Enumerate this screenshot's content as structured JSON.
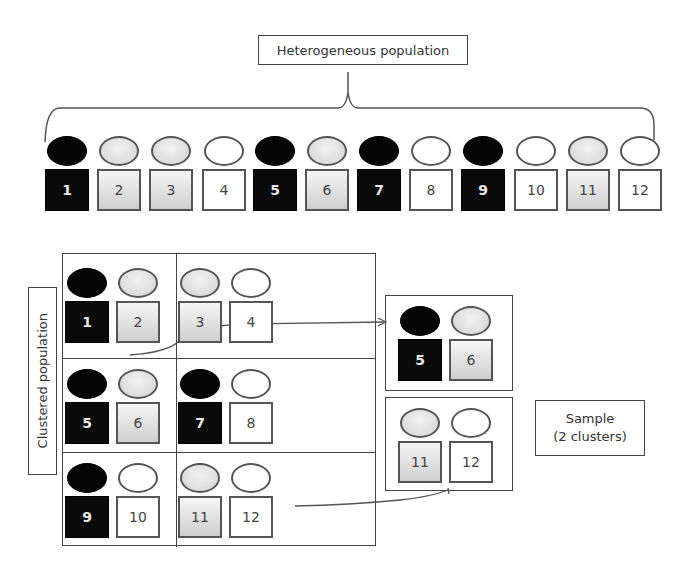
{
  "title_label": "Heterogeneous population",
  "population": [
    {
      "id": "1",
      "shade": "black"
    },
    {
      "id": "2",
      "shade": "gray"
    },
    {
      "id": "3",
      "shade": "gray"
    },
    {
      "id": "4",
      "shade": "white"
    },
    {
      "id": "5",
      "shade": "black"
    },
    {
      "id": "6",
      "shade": "gray"
    },
    {
      "id": "7",
      "shade": "black"
    },
    {
      "id": "8",
      "shade": "white"
    },
    {
      "id": "9",
      "shade": "black"
    },
    {
      "id": "10",
      "shade": "white"
    },
    {
      "id": "11",
      "shade": "gray"
    },
    {
      "id": "12",
      "shade": "white"
    }
  ],
  "clustered_label": "Clustered population",
  "clusters": [
    {
      "members": [
        "1",
        "2"
      ]
    },
    {
      "members": [
        "3",
        "4"
      ]
    },
    {
      "members": [
        "5",
        "6"
      ]
    },
    {
      "members": [
        "7",
        "8"
      ]
    },
    {
      "members": [
        "9",
        "10"
      ]
    },
    {
      "members": [
        "11",
        "12"
      ]
    }
  ],
  "sample": {
    "label_line1": "Sample",
    "label_line2": "(2 clusters)",
    "clusters": [
      {
        "members": [
          "5",
          "6"
        ]
      },
      {
        "members": [
          "11",
          "12"
        ]
      }
    ]
  },
  "colors": {
    "black": "#050505",
    "gray": "#dcdcdc",
    "white": "#ffffff",
    "stroke": "#444444"
  }
}
